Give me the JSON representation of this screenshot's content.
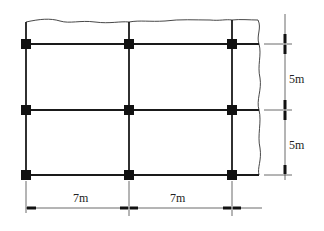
{
  "diagram": {
    "type": "structural-grid-plan",
    "columns": 3,
    "rows": 3,
    "spans_x": [
      {
        "label": "7m",
        "value_m": 7
      },
      {
        "label": "7m",
        "value_m": 7
      }
    ],
    "spans_y": [
      {
        "label": "5m",
        "value_m": 5
      },
      {
        "label": "5m",
        "value_m": 5
      }
    ],
    "nodes": [
      {
        "row": 0,
        "col": 0
      },
      {
        "row": 0,
        "col": 1
      },
      {
        "row": 0,
        "col": 2
      },
      {
        "row": 1,
        "col": 0
      },
      {
        "row": 1,
        "col": 1
      },
      {
        "row": 1,
        "col": 2
      },
      {
        "row": 2,
        "col": 0
      },
      {
        "row": 2,
        "col": 1
      },
      {
        "row": 2,
        "col": 2
      }
    ],
    "break_lines": [
      "top",
      "right"
    ],
    "colors": {
      "line": "#1a1a1a",
      "column": "#111111",
      "dimension": "#444444"
    }
  }
}
